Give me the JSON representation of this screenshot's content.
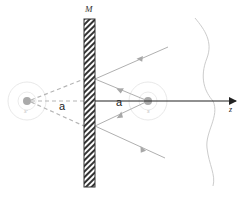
{
  "diagram": {
    "mirror_label": "M",
    "distance_label_left": "a",
    "distance_label_right": "a",
    "axis_label": "z",
    "source_label": "S",
    "image_source_label": "S′",
    "colors": {
      "mirror_hatch": "#333333",
      "axis": "#222222",
      "rays": "#b0b0b0",
      "dashed_rays": "#b5b5b5",
      "wavefront": "#cccccc",
      "source_dot": "#aaaaaa",
      "source_rings": "#dddddd"
    }
  }
}
